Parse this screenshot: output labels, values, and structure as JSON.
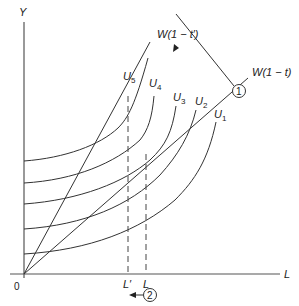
{
  "diagram": {
    "type": "labour-leisure tax diagram",
    "axes": {
      "y_label": "Y",
      "x_label": "L",
      "origin_label": "0"
    },
    "budget_lines": [
      {
        "id": "w1mt",
        "label": "W(1 − t)",
        "description": "after-tax wage line, shallow"
      },
      {
        "id": "w1mtp",
        "label": "W(1 − t′)",
        "description": "after-tax wage line, steep (lower tax)"
      }
    ],
    "indifference_curves": [
      {
        "id": "u1",
        "base": "U",
        "sub": "1"
      },
      {
        "id": "u2",
        "base": "U",
        "sub": "2"
      },
      {
        "id": "u3",
        "base": "U",
        "sub": "3"
      },
      {
        "id": "u4",
        "base": "U",
        "sub": "4"
      },
      {
        "id": "u5",
        "base": "U",
        "sub": "5"
      }
    ],
    "markers": [
      {
        "id": "L",
        "label": "L"
      },
      {
        "id": "Lp",
        "label": "L′"
      }
    ],
    "callouts": [
      {
        "id": "c1",
        "label": "1",
        "description": "rotation of budget line from W(1−t) to W(1−t′)"
      },
      {
        "id": "c2",
        "label": "2",
        "description": "leftward shift of labour from L to L′"
      }
    ],
    "colors": {
      "line": "#333333",
      "axis": "#555555",
      "background": "#ffffff"
    }
  }
}
